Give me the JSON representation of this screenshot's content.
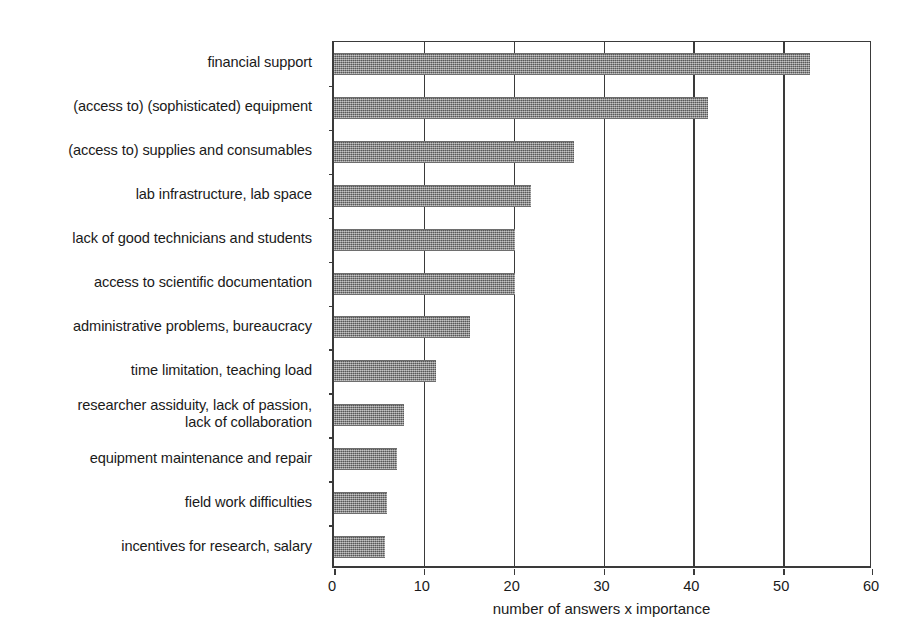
{
  "chart_data": {
    "type": "bar",
    "orientation": "horizontal",
    "title": "",
    "xlabel": "number of answers x importance",
    "ylabel": "",
    "xlim": [
      0,
      60
    ],
    "xticks": [
      0,
      10,
      20,
      30,
      40,
      50,
      60
    ],
    "xtick_labels": [
      "0",
      "10",
      "20",
      "30",
      "40",
      "50",
      "60"
    ],
    "grid": true,
    "grid_axis": "x",
    "legend": false,
    "bar_color": "#808080",
    "bar_pattern": "dither-halftone-gray",
    "axis_color": "#3a3a3a",
    "background": "#ffffff",
    "categories": [
      "financial support",
      "(access to) (sophisticated) equipment",
      "(access to) supplies and consumables",
      "lab infrastructure, lab space",
      "lack of good technicians and students",
      "access to scientific documentation",
      "administrative problems, bureaucracy",
      "time limitation, teaching load",
      "researcher assiduity, lack of passion, lack of collaboration",
      "equipment maintenance and repair",
      "field work difficulties",
      "incentives for research, salary"
    ],
    "category_lines": [
      [
        "financial support"
      ],
      [
        "(access to) (sophisticated) equipment"
      ],
      [
        "(access to) supplies and consumables"
      ],
      [
        "lab infrastructure, lab space"
      ],
      [
        "lack of good technicians and students"
      ],
      [
        "access to scientific documentation"
      ],
      [
        "administrative problems, bureaucracy"
      ],
      [
        "time limitation, teaching load"
      ],
      [
        "researcher assiduity, lack of passion,",
        "lack of collaboration"
      ],
      [
        "equipment maintenance and repair"
      ],
      [
        "field work difficulties"
      ],
      [
        "incentives for research, salary"
      ]
    ],
    "values": [
      53,
      41.6,
      26.7,
      21.9,
      20.2,
      20.2,
      15.1,
      11.3,
      7.8,
      7.0,
      5.9,
      5.7
    ]
  }
}
